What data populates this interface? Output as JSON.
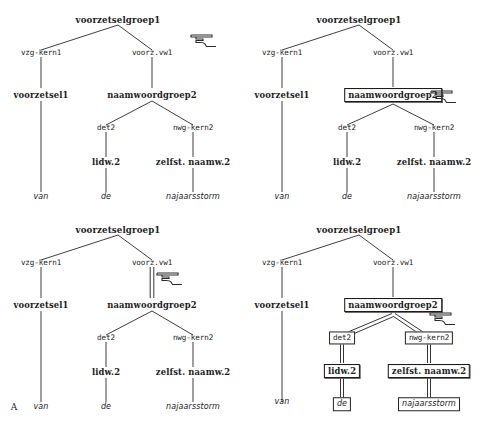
{
  "figure": {
    "caption_letter": "A",
    "cursor_icon": "pointing-hand-cursor"
  },
  "tree": {
    "nodes": {
      "root": "voorzetselgroep1",
      "left_branch": "vzg-kern1",
      "right_branch": "voorz.vw1",
      "preposition": "voorzetsel1",
      "noun_phrase": "naamwoordgroep2",
      "determiner": "det2",
      "nwg_head": "nwg-kern2",
      "article": "lidw.2",
      "noun": "zelfst. naamw.2",
      "leaf_van": "van",
      "leaf_de": "de",
      "leaf_najaarsstorm": "najaarsstorm"
    }
  },
  "panels": [
    {
      "id": "panel-1",
      "name": "unselected-tree",
      "selection": "none",
      "cursor_visible": true,
      "caption": ""
    },
    {
      "id": "panel-2",
      "name": "node-selected-tree",
      "selection": "naamwoordgroep2",
      "cursor_visible": true,
      "caption": ""
    },
    {
      "id": "panel-3",
      "name": "edge-selected-tree",
      "selection": "edge-voorz.vw1-naamwoordgroep2",
      "cursor_visible": true,
      "caption": "A"
    },
    {
      "id": "panel-4",
      "name": "subtree-selected-tree",
      "selection": "subtree-naamwoordgroep2",
      "cursor_visible": true,
      "caption": ""
    }
  ]
}
